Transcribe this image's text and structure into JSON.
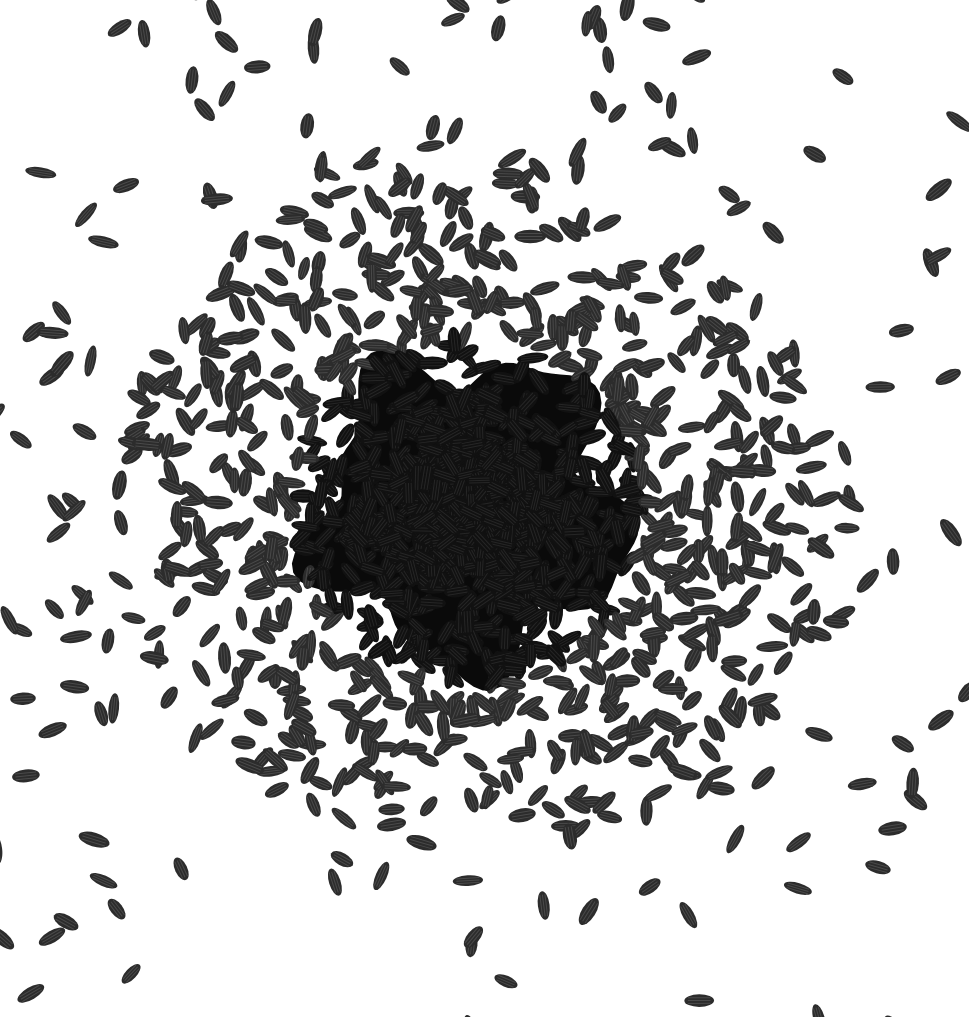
{
  "image": {
    "subject": "Black rice grains scattered on a white background",
    "width": 969,
    "height": 1017,
    "background_color": "#ffffff",
    "grain_color": "#2c2c2c",
    "grain_highlight_color": "#4a4a4a",
    "dense_core_color": "#0a0a0a"
  },
  "layout": {
    "cluster_center": [
      470,
      510
    ],
    "dense_core_radius": 175,
    "grain_length": 28,
    "grain_width": 12,
    "grain_count": 1900
  }
}
